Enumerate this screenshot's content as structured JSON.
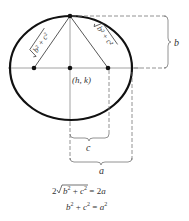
{
  "diagram": {
    "center_label": "(h, k)",
    "left_segment_label": "√(b² + c²)",
    "right_segment_label": "√(b² + c²)",
    "labels": {
      "b": "b",
      "c": "c",
      "a": "a"
    },
    "equations": [
      "2√(b² + c²) = 2a",
      "b² + c² = a²"
    ],
    "colors": {
      "ellipse": "#111111",
      "axes": "#888888",
      "dashes": "#777777",
      "text": "#333333"
    }
  }
}
